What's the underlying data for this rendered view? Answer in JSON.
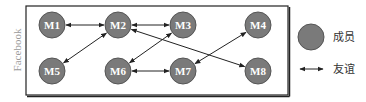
{
  "diagram": {
    "container_label": "Facebook",
    "colors": {
      "node_fill": "#7a7a7a",
      "node_stroke": "#555555",
      "node_text": "#ffffff",
      "edge": "#222222",
      "frame": "#222222",
      "side_label": "#9a9a9a"
    },
    "nodes": [
      {
        "id": "M1",
        "label": "M1",
        "x": 52,
        "y": 25
      },
      {
        "id": "M2",
        "label": "M2",
        "x": 118,
        "y": 25
      },
      {
        "id": "M3",
        "label": "M3",
        "x": 183,
        "y": 25
      },
      {
        "id": "M4",
        "label": "M4",
        "x": 258,
        "y": 25
      },
      {
        "id": "M5",
        "label": "M5",
        "x": 52,
        "y": 71
      },
      {
        "id": "M6",
        "label": "M6",
        "x": 118,
        "y": 71
      },
      {
        "id": "M7",
        "label": "M7",
        "x": 183,
        "y": 71
      },
      {
        "id": "M8",
        "label": "M8",
        "x": 258,
        "y": 71
      }
    ],
    "edges": [
      {
        "from": "M1",
        "to": "M2",
        "type": "bidirectional"
      },
      {
        "from": "M2",
        "to": "M3",
        "type": "bidirectional"
      },
      {
        "from": "M2",
        "to": "M5",
        "type": "bidirectional"
      },
      {
        "from": "M2",
        "to": "M8",
        "type": "bidirectional"
      },
      {
        "from": "M3",
        "to": "M6",
        "type": "bidirectional"
      },
      {
        "from": "M6",
        "to": "M7",
        "type": "bidirectional"
      },
      {
        "from": "M7",
        "to": "M4",
        "type": "bidirectional"
      }
    ]
  },
  "legend": {
    "member_label": "成员",
    "friendship_label": "友谊"
  }
}
